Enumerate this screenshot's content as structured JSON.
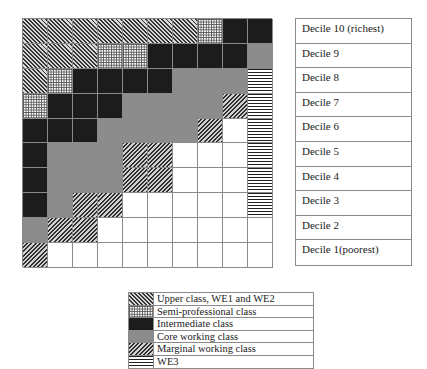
{
  "grid": {
    "columns": 10,
    "rows": 10,
    "cells": [
      [
        "U",
        "U",
        "U",
        "U",
        "U",
        "U",
        "U",
        "S",
        "I",
        "I"
      ],
      [
        "U",
        "U",
        "U",
        "S",
        "S",
        "I",
        "I",
        "I",
        "I",
        "C"
      ],
      [
        "U",
        "S",
        "I",
        "I",
        "I",
        "I",
        "C",
        "C",
        "C",
        "W"
      ],
      [
        "S",
        "I",
        "I",
        "I",
        "C",
        "C",
        "C",
        "C",
        "M",
        "W"
      ],
      [
        "I",
        "I",
        "I",
        "C",
        "C",
        "C",
        "C",
        "M",
        "E",
        "W"
      ],
      [
        "I",
        "C",
        "C",
        "C",
        "M",
        "M",
        "E",
        "E",
        "E",
        "W"
      ],
      [
        "I",
        "C",
        "C",
        "C",
        "M",
        "M",
        "E",
        "E",
        "E",
        "W"
      ],
      [
        "I",
        "C",
        "M",
        "M",
        "E",
        "E",
        "E",
        "E",
        "E",
        "W"
      ],
      [
        "C",
        "M",
        "M",
        "E",
        "E",
        "E",
        "E",
        "E",
        "E",
        "E"
      ],
      [
        "M",
        "E",
        "E",
        "E",
        "E",
        "E",
        "E",
        "E",
        "E",
        "E"
      ]
    ]
  },
  "deciles": [
    {
      "label": "Decile 10 (richest)"
    },
    {
      "label": "Decile 9"
    },
    {
      "label": "Decile 8"
    },
    {
      "label": "Decile 7"
    },
    {
      "label": "Decile 6"
    },
    {
      "label": "Decile 5"
    },
    {
      "label": "Decile 4"
    },
    {
      "label": "Decile 3"
    },
    {
      "label": "Decile 2"
    },
    {
      "label": "Decile 1(poorest)"
    }
  ],
  "legend": [
    {
      "code": "U",
      "label": "Upper class, WE1 and WE2",
      "pattern": "diagonal-hatch-dense",
      "color": "#333333"
    },
    {
      "code": "S",
      "label": "Semi-professional class",
      "pattern": "crosshatch-grid",
      "color": "#555555"
    },
    {
      "code": "I",
      "label": "Intermediate class",
      "pattern": "solid",
      "color": "#1c1c1c"
    },
    {
      "code": "C",
      "label": "Core working class",
      "pattern": "solid",
      "color": "#8c8c8c"
    },
    {
      "code": "M",
      "label": "Marginal working class",
      "pattern": "diagonal-hatch",
      "color": "#2e2e2e"
    },
    {
      "code": "W",
      "label": "WE3",
      "pattern": "horizontal-stripes",
      "color": "#1f1f1f"
    }
  ]
}
